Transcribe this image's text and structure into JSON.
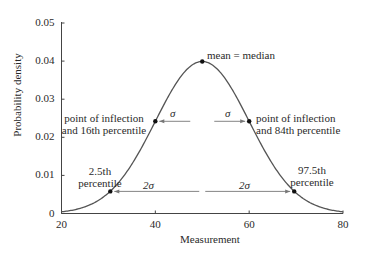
{
  "chart_data": {
    "type": "line",
    "title": "",
    "xlabel": "Measurement",
    "ylabel": "Probability density",
    "xlim": [
      20,
      80
    ],
    "ylim": [
      0,
      0.05
    ],
    "x_ticks": [
      "20",
      "40",
      "60",
      "80"
    ],
    "y_ticks": [
      "0",
      "0.01",
      "0.02",
      "0.03",
      "0.04",
      "0.05"
    ],
    "grid": false,
    "legend": "none",
    "distribution": {
      "name": "normal",
      "mean": 50,
      "sd": 10
    },
    "series": [
      {
        "name": "Normal density",
        "x": [
          20,
          25,
          30,
          35,
          40,
          45,
          50,
          55,
          60,
          65,
          70,
          75,
          80
        ],
        "values": [
          0.0004,
          0.0018,
          0.0054,
          0.013,
          0.0242,
          0.0352,
          0.0399,
          0.0352,
          0.0242,
          0.013,
          0.0054,
          0.0018,
          0.0004
        ]
      }
    ],
    "marked_points": [
      {
        "label": "mean = median",
        "x": 50,
        "y": 0.0399
      },
      {
        "label": "point of inflection and 16th percentile",
        "x": 40,
        "y": 0.0242
      },
      {
        "label": "point of inflection and 84th percentile",
        "x": 60,
        "y": 0.0242
      },
      {
        "label": "2.5th percentile",
        "x": 30.4,
        "y": 0.0058
      },
      {
        "label": "97.5th percentile",
        "x": 69.6,
        "y": 0.0058
      }
    ],
    "annotations": [
      {
        "text": "σ",
        "type": "arrow",
        "from_x": 50,
        "to_x": 40,
        "y": 0.0242
      },
      {
        "text": "σ",
        "type": "arrow",
        "from_x": 50,
        "to_x": 60,
        "y": 0.0242
      },
      {
        "text": "2σ",
        "type": "arrow",
        "from_x": 50,
        "to_x": 30.4,
        "y": 0.0058
      },
      {
        "text": "2σ",
        "type": "arrow",
        "from_x": 50,
        "to_x": 69.6,
        "y": 0.0058
      }
    ]
  },
  "labels": {
    "mean": "mean = median",
    "infl_left_1": "point of inflection",
    "infl_left_2": "and 16th percentile",
    "infl_right_1": "point of inflection",
    "infl_right_2": "and 84th percentile",
    "p25_1": "2.5th",
    "p25_2": "percentile",
    "p975_1": "97.5th",
    "p975_2": "percentile",
    "sigma": "σ",
    "two_sigma": "2σ"
  }
}
